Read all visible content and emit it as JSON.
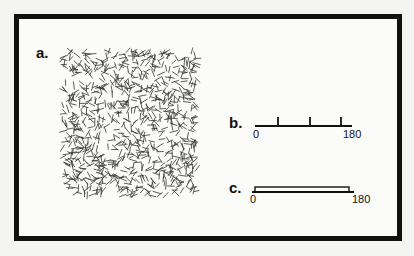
{
  "figure": {
    "panels": [
      {
        "id": "a",
        "label": "a.",
        "description": "random texture of short oriented line segments"
      },
      {
        "id": "b",
        "label": "b.",
        "axis_min_label": "0",
        "axis_max_label": "180",
        "tick_positions_deg": [
          45,
          105,
          160
        ]
      },
      {
        "id": "c",
        "label": "c.",
        "axis_min_label": "0",
        "axis_max_label": "180",
        "bar_range_deg": [
          0,
          180
        ]
      }
    ]
  },
  "colors": {
    "ink": "#111111",
    "background": "#fbfbfa",
    "outer": "#f4f4f2"
  }
}
